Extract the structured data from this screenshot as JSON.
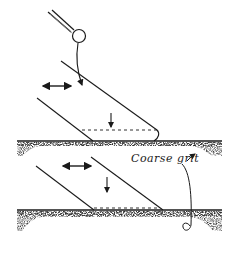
{
  "diagram": {
    "type": "technical-illustration",
    "colors": {
      "ink": "#1a1a1a",
      "stone": "#2b2b2b",
      "background": "#ffffff"
    },
    "panels": [
      {
        "id": "top",
        "description": "Blade held at angle on stone with finger pressure; side-to-side motion arrow; downward arrow onto dashed bevel line; burr at tip",
        "elements": [
          "finger-pressure-circle",
          "push-arrow",
          "horizontal-motion-arrow",
          "blade",
          "dashed-bevel-line",
          "down-arrow",
          "stone"
        ]
      },
      {
        "id": "bottom",
        "description": "Blade lying flat at bevel angle on stone; side-to-side motion arrow; downward arrow; dashed bevel line",
        "elements": [
          "horizontal-motion-arrow",
          "blade",
          "dashed-bevel-line",
          "down-arrow",
          "stone"
        ]
      }
    ],
    "annotations": [
      {
        "text": "Coarse grit",
        "points_to": "stone surface"
      }
    ]
  }
}
